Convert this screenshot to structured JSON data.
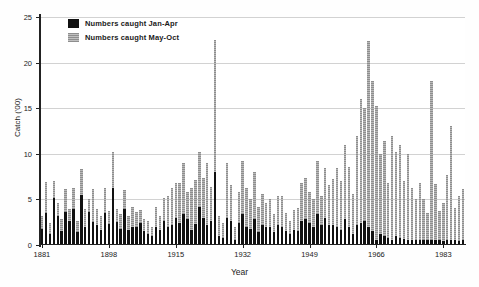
{
  "chart_data": {
    "type": "bar",
    "title": "",
    "xlabel": "Year",
    "ylabel": "Catch ('00)",
    "stacked": true,
    "grid": true,
    "legend_position": "top-left",
    "ylim": [
      0,
      25
    ],
    "yticks": [
      0,
      5,
      10,
      15,
      20,
      25
    ],
    "xlim": [
      1881,
      1988
    ],
    "xticks": [
      1881,
      1898,
      1915,
      1932,
      1949,
      1966,
      1983
    ],
    "xtick_labels": [
      "1881",
      "1898",
      "1915",
      "1932",
      "1949",
      "1966",
      "1983"
    ],
    "colors": {
      "jan_apr": "#111111",
      "may_oct": "#9a9a9a",
      "grid": "#d2d2d2",
      "axis": "#222222",
      "background": "#ffffff"
    },
    "series": [
      {
        "name": "Numbers caught Jan-Apr",
        "color": "#111111",
        "values": [
          1.8,
          3.5,
          1.2,
          5.2,
          3.2,
          1.5,
          3.6,
          2.6,
          4.0,
          1.4,
          5.5,
          2.0,
          3.6,
          2.5,
          2.2,
          1.6,
          3.5,
          2.3,
          6.2,
          2.5,
          1.8,
          4.0,
          1.6,
          2.0,
          2.0,
          2.4,
          1.5,
          1.2,
          1.0,
          2.0,
          1.6,
          2.6,
          2.0,
          2.2,
          3.0,
          2.4,
          3.4,
          2.8,
          1.6,
          2.3,
          4.2,
          3.0,
          2.2,
          2.6,
          8.0,
          1.0,
          0.8,
          3.0,
          2.6,
          0.5,
          2.4,
          3.4,
          2.0,
          1.8,
          2.8,
          1.4,
          2.2,
          2.0,
          2.0,
          1.4,
          2.2,
          2.0,
          1.5,
          1.2,
          1.6,
          1.5,
          2.6,
          2.8,
          2.4,
          2.0,
          3.4,
          2.2,
          3.0,
          2.2,
          2.2,
          2.0,
          1.6,
          2.8,
          2.0,
          1.2,
          2.2,
          2.4,
          2.6,
          2.0,
          1.5,
          0.6,
          1.2,
          1.0,
          0.8,
          0.6,
          1.0,
          0.8,
          0.7,
          0.5,
          0.6,
          0.5,
          0.6,
          0.5,
          0.5,
          0.6,
          0.5,
          0.5,
          0.4,
          0.5,
          0.6,
          0.5,
          0.4,
          0.5
        ]
      },
      {
        "name": "Numbers caught May-Oct",
        "color": "#9a9a9a",
        "values": [
          1.4,
          3.4,
          1.2,
          1.8,
          1.4,
          1.4,
          2.5,
          1.4,
          2.2,
          1.2,
          2.8,
          2.0,
          1.4,
          3.6,
          1.8,
          1.6,
          2.8,
          1.4,
          4.0,
          1.4,
          1.6,
          2.0,
          1.6,
          2.2,
          1.6,
          1.4,
          1.4,
          1.4,
          1.0,
          2.2,
          1.6,
          2.6,
          3.4,
          4.0,
          3.8,
          4.4,
          5.6,
          3.0,
          4.6,
          4.8,
          6.0,
          4.4,
          6.8,
          3.8,
          14.5,
          2.2,
          1.6,
          6.0,
          4.0,
          1.5,
          3.4,
          5.8,
          4.2,
          3.2,
          5.2,
          2.8,
          3.4,
          2.6,
          3.0,
          2.0,
          3.2,
          3.4,
          2.0,
          1.4,
          2.2,
          2.6,
          4.2,
          4.6,
          3.4,
          3.0,
          5.8,
          3.2,
          5.4,
          4.4,
          5.0,
          6.4,
          5.4,
          8.2,
          6.6,
          4.4,
          9.8,
          13.6,
          12.4,
          20.4,
          16.5,
          14.6,
          8.8,
          10.4,
          6.0,
          11.4,
          9.2,
          10.2,
          6.3,
          9.5,
          5.6,
          4.6,
          6.2,
          4.5,
          3.0,
          17.4,
          6.2,
          3.2,
          4.2,
          7.2,
          12.4,
          3.6,
          5.0,
          5.6
        ]
      }
    ],
    "x": [
      1881,
      1882,
      1883,
      1884,
      1885,
      1886,
      1887,
      1888,
      1889,
      1890,
      1891,
      1892,
      1893,
      1894,
      1895,
      1896,
      1897,
      1898,
      1899,
      1900,
      1901,
      1902,
      1903,
      1904,
      1905,
      1906,
      1907,
      1908,
      1909,
      1910,
      1911,
      1912,
      1913,
      1914,
      1915,
      1916,
      1917,
      1918,
      1919,
      1920,
      1921,
      1922,
      1923,
      1924,
      1925,
      1926,
      1927,
      1928,
      1929,
      1930,
      1931,
      1932,
      1933,
      1934,
      1935,
      1936,
      1937,
      1938,
      1939,
      1940,
      1941,
      1942,
      1943,
      1944,
      1945,
      1946,
      1947,
      1948,
      1949,
      1950,
      1951,
      1952,
      1953,
      1954,
      1955,
      1956,
      1957,
      1958,
      1959,
      1960,
      1961,
      1962,
      1963,
      1964,
      1965,
      1966,
      1967,
      1968,
      1969,
      1970,
      1971,
      1972,
      1973,
      1974,
      1975,
      1976,
      1977,
      1978,
      1979,
      1980,
      1981,
      1982,
      1983,
      1984,
      1985,
      1986,
      1987,
      1988
    ]
  },
  "legend": {
    "items": [
      {
        "label": "Numbers caught Jan-Apr",
        "swatch": "sw-black"
      },
      {
        "label": "Numbers caught May-Oct",
        "swatch": "sw-gray"
      }
    ]
  },
  "axes": {
    "y_title": "Catch ('00)",
    "x_title": "Year"
  }
}
